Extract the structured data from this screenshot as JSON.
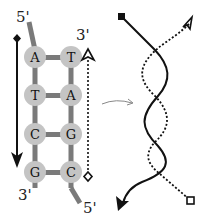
{
  "ladder": {
    "top_left_label": "5'",
    "top_right_label": "3'",
    "bottom_left_label": "3'",
    "bottom_right_label": "5'",
    "pairs": [
      {
        "left": "A",
        "right": "T"
      },
      {
        "left": "T",
        "right": "A"
      },
      {
        "left": "C",
        "right": "G"
      },
      {
        "left": "G",
        "right": "C"
      }
    ]
  },
  "colors": {
    "backbone": "#7a7a7a",
    "base_fill": "#c4c4c4",
    "ink": "#111111"
  }
}
